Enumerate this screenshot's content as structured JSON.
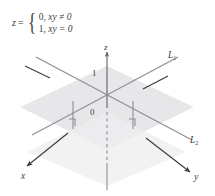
{
  "figure": {
    "name": "3d-coordinate-diagram",
    "background_color": "#ffffff",
    "line_color": "#8a8f9a",
    "plane_color": "#e7e7ea",
    "band_color": "#ffffff",
    "text_color": "#3d3d3d",
    "pointer_color": "#3a3a3a"
  },
  "formula": {
    "lhs": "z",
    "equals": "=",
    "brace": "{",
    "cases": [
      {
        "value": "0,",
        "condition": "xy ≠ 0"
      },
      {
        "value": "1,",
        "condition": "xy = 0"
      }
    ]
  },
  "axes": [
    {
      "key": "z",
      "label": "z",
      "direction": "up",
      "arrow": true,
      "dashed_below_origin": true
    },
    {
      "key": "x",
      "label": "x",
      "direction": "down-left",
      "arrow": true,
      "dashed_below_origin": false
    },
    {
      "key": "y",
      "label": "y",
      "direction": "down-right",
      "arrow": true,
      "dashed_below_origin": false
    }
  ],
  "lines": [
    {
      "key": "L1",
      "label": "L",
      "subscript": "1"
    },
    {
      "key": "L2",
      "label": "L",
      "subscript": "2"
    }
  ],
  "markers": [
    {
      "key": "one",
      "label": "1"
    },
    {
      "key": "origin",
      "label": "0"
    }
  ],
  "annotations": {
    "leader_left": "pointer-to-plane-left",
    "leader_right": "pointer-to-plane-right",
    "drop_left": "drop-line-left",
    "drop_right": "drop-line-right"
  }
}
